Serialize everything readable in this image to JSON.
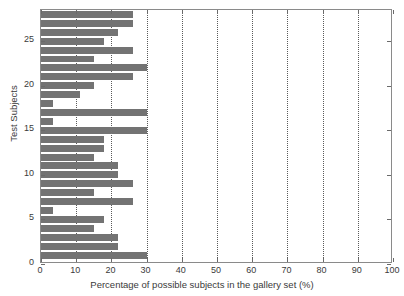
{
  "chart_data": {
    "type": "bar",
    "orientation": "horizontal",
    "title": "",
    "xlabel": "Percentage of possible subjects in the gallery set (%)",
    "ylabel": "Test Subjects",
    "xlim": [
      0,
      100
    ],
    "ylim": [
      0,
      28.5
    ],
    "xticks": [
      0,
      10,
      20,
      30,
      40,
      50,
      60,
      70,
      80,
      90,
      100
    ],
    "xticklabels": [
      "0",
      "10",
      "20",
      "30",
      "40",
      "50",
      "60",
      "70",
      "80",
      "90",
      "100"
    ],
    "yticks": [
      0,
      5,
      10,
      15,
      20,
      25
    ],
    "yticklabels": [
      "0",
      "5",
      "10",
      "15",
      "20",
      "25"
    ],
    "grid": "vertical-dotted",
    "legend": "none",
    "bar_color": "#737373",
    "axis_color": "#8a8a8a",
    "categories": [
      1,
      2,
      3,
      4,
      5,
      6,
      7,
      8,
      9,
      10,
      11,
      12,
      13,
      14,
      15,
      16,
      17,
      18,
      19,
      20,
      21,
      22,
      23,
      24,
      25,
      26,
      27,
      28
    ],
    "values": [
      30,
      22,
      22,
      15,
      18,
      3.5,
      26,
      15,
      26,
      22,
      22,
      15,
      18,
      18,
      30,
      3.5,
      30,
      3.5,
      11,
      15,
      26,
      30,
      15,
      26,
      18,
      22,
      26,
      26
    ]
  }
}
